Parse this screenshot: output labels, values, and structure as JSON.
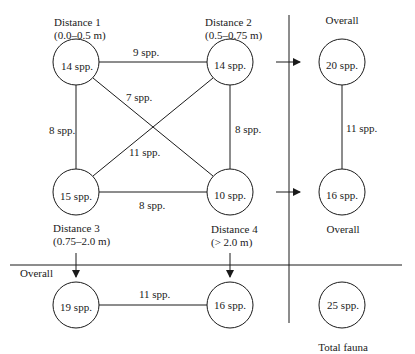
{
  "diagram": {
    "nodes": {
      "d1": {
        "title": "Distance 1",
        "range": "(0.0–0.5 m)",
        "value": "14 spp."
      },
      "d2": {
        "title": "Distance 2",
        "range": "(0.5–0.75 m)",
        "value": "14 spp."
      },
      "d3": {
        "title": "Distance 3",
        "range": "(0.75–2.0 m)",
        "value": "15 spp."
      },
      "d4": {
        "title": "Distance 4",
        "range": "(> 2.0 m)",
        "value": "10 spp."
      },
      "overall_top": {
        "title": "Overall",
        "value": "20 spp."
      },
      "overall_right": {
        "title": "Overall",
        "value": "16 spp."
      },
      "overall_left_bottom": {
        "value": "19 spp."
      },
      "overall_right_bottom": {
        "value": "16 spp."
      },
      "total": {
        "title": "Total fauna",
        "value": "25 spp."
      }
    },
    "edges": {
      "d1_d2": "9 spp.",
      "d1_d4": "7 spp.",
      "d1_d3": "8 spp.",
      "d2_d3": "11 spp.",
      "d2_d4": "8 spp.",
      "d3_d4": "8 spp.",
      "overall_vertical": "11 spp.",
      "overall_horizontal": "11 spp."
    },
    "overall_row_label": "Overall"
  }
}
